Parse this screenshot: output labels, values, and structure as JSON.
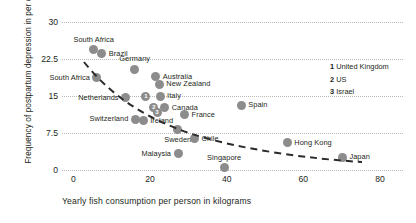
{
  "chart_data": {
    "type": "scatter",
    "title": "",
    "xlabel": "Yearly fish consumption per person in kilograms",
    "ylabel": "Frequency of postpartum depression in per cent",
    "xlim": [
      -3,
      86
    ],
    "ylim": [
      0,
      30
    ],
    "xticks": [
      0,
      20,
      40,
      60,
      80
    ],
    "yticks": [
      0,
      7.5,
      15,
      22.5,
      30
    ],
    "grid": "horizontal-dotted",
    "legend_position": "right",
    "trendline": "dashed-decreasing-curve",
    "points": [
      {
        "label": "South Africa",
        "x": 5.2,
        "y": 24.4,
        "label_pos": "above"
      },
      {
        "label": "Brazil",
        "x": 7.4,
        "y": 23.6,
        "label_pos": "right"
      },
      {
        "label": "South Africa",
        "x": 6.0,
        "y": 18.7,
        "label_pos": "left"
      },
      {
        "label": "Germany",
        "x": 16.0,
        "y": 20.4,
        "label_pos": "above"
      },
      {
        "label": "Australia",
        "x": 21.5,
        "y": 18.9,
        "label_pos": "right"
      },
      {
        "label": "New Zealand",
        "x": 22.4,
        "y": 17.4,
        "label_pos": "right"
      },
      {
        "label": "Netherlands",
        "x": 13.5,
        "y": 14.6,
        "label_pos": "left"
      },
      {
        "label": "Italy",
        "x": 22.6,
        "y": 14.9,
        "label_pos": "right"
      },
      {
        "label": "Canada",
        "x": 23.8,
        "y": 12.6,
        "label_pos": "right"
      },
      {
        "label": "France",
        "x": 29.0,
        "y": 11.2,
        "label_pos": "right"
      },
      {
        "label": "Spain",
        "x": 43.8,
        "y": 13.1,
        "label_pos": "right"
      },
      {
        "label": "Switzerland",
        "x": 16.2,
        "y": 10.3,
        "label_pos": "left"
      },
      {
        "label": "Ireland",
        "x": 18.2,
        "y": 10.0,
        "label_pos": "right"
      },
      {
        "label": "Sweden",
        "x": 27.2,
        "y": 8.3,
        "label_pos": "below"
      },
      {
        "label": "Chile",
        "x": 31.6,
        "y": 6.3,
        "label_pos": "right"
      },
      {
        "label": "Malaysia",
        "x": 27.4,
        "y": 3.3,
        "label_pos": "left"
      },
      {
        "label": "Singapore",
        "x": 39.3,
        "y": 0.5,
        "label_pos": "above"
      },
      {
        "label": "Hong Kong",
        "x": 55.8,
        "y": 5.5,
        "label_pos": "right"
      },
      {
        "label": "Japan",
        "x": 70.2,
        "y": 2.6,
        "label_pos": "right"
      }
    ],
    "numbered_points": [
      {
        "num": "1",
        "label": "United Kingdom",
        "x": 18.9,
        "y": 14.9
      },
      {
        "num": "2",
        "label": "US",
        "x": 21.0,
        "y": 12.7
      },
      {
        "num": "3",
        "label": "Israel",
        "x": 21.8,
        "y": 11.6
      }
    ]
  },
  "legend": {
    "items": [
      {
        "num": "1",
        "name": "United Kingdom"
      },
      {
        "num": "2",
        "name": "US"
      },
      {
        "num": "3",
        "name": "Israel"
      }
    ]
  },
  "colors": {
    "point": "#8c8c8c",
    "grid": "#b9b9b9",
    "text": "#231f20",
    "trendline": "#2b2b2b"
  }
}
